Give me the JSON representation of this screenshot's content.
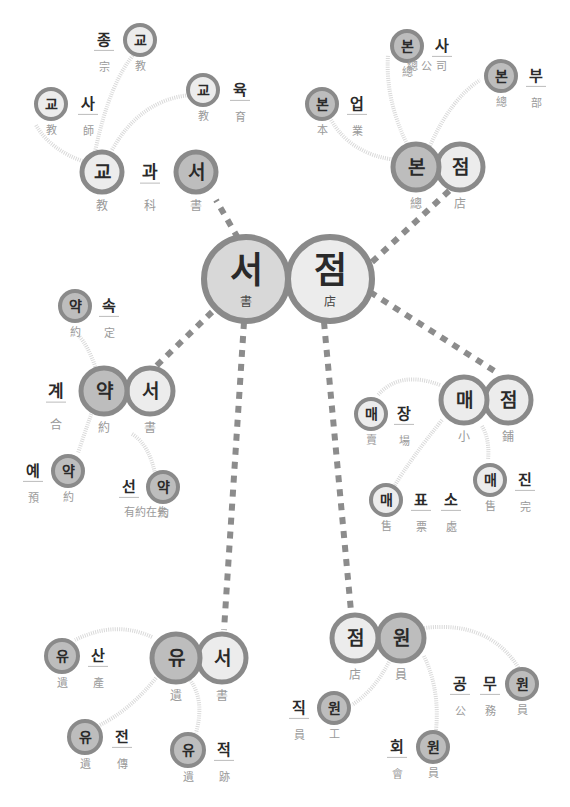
{
  "colors": {
    "ring": "#8a8a8a",
    "fill_light": "#ececec",
    "fill_mid": "#d8d8d8",
    "fill_dark": "#bdbdbd",
    "dash": "#8c8c8c",
    "arc": "#d9d9d9",
    "hangul": "#2a2a2a",
    "hanja": "#9a9a9a"
  },
  "center": {
    "word": "서점",
    "nodes": [
      {
        "x": 246,
        "y": 279,
        "r": 42,
        "char": "서",
        "hanja": "書",
        "fill": "fill_mid"
      },
      {
        "x": 330,
        "y": 279,
        "r": 42,
        "char": "점",
        "hanja": "店",
        "fill": "fill_light"
      }
    ]
  },
  "dashes": [
    {
      "x1": 238,
      "y1": 238,
      "x2": 216,
      "y2": 200
    },
    {
      "x1": 372,
      "y1": 262,
      "x2": 450,
      "y2": 190
    },
    {
      "x1": 212,
      "y1": 312,
      "x2": 150,
      "y2": 372
    },
    {
      "x1": 370,
      "y1": 292,
      "x2": 496,
      "y2": 372
    },
    {
      "x1": 244,
      "y1": 322,
      "x2": 224,
      "y2": 630
    },
    {
      "x1": 324,
      "y1": 322,
      "x2": 352,
      "y2": 622
    }
  ],
  "clusters": [
    {
      "name": "gyogwaseo",
      "word": "교과서",
      "nodes": [
        {
          "x": 102,
          "y": 172,
          "r": 20,
          "char": "교",
          "hanja": "教",
          "fill": "fill_light"
        },
        {
          "x": 196,
          "y": 172,
          "r": 20,
          "char": "서",
          "hanja": "書",
          "fill": "fill_dark"
        }
      ],
      "labels": [
        {
          "x": 150,
          "y": 172,
          "char": "과",
          "hanja": "科"
        }
      ],
      "arcs": [
        "M95,152 Q110,80 136,52",
        "M85,162 Q50,150 36,125",
        "M112,150 Q140,100 190,95"
      ],
      "sub": [
        {
          "word": "종교",
          "nodes": [
            {
              "x": 140,
              "y": 40,
              "r": 15,
              "char": "교",
              "hanja": "教",
              "fill": "fill_light"
            }
          ],
          "labels": [
            {
              "x": 104,
              "y": 40,
              "char": "종",
              "hanja": "宗"
            }
          ]
        },
        {
          "word": "교사",
          "nodes": [
            {
              "x": 51,
              "y": 104,
              "r": 15,
              "char": "교",
              "hanja": "教",
              "fill": "fill_light"
            }
          ],
          "labels": [
            {
              "x": 88,
              "y": 104,
              "char": "사",
              "hanja": "師"
            }
          ]
        },
        {
          "word": "교육",
          "nodes": [
            {
              "x": 203,
              "y": 90,
              "r": 15,
              "char": "교",
              "hanja": "教",
              "fill": "fill_light"
            }
          ],
          "labels": [
            {
              "x": 240,
              "y": 90,
              "char": "육",
              "hanja": "育"
            }
          ]
        }
      ]
    },
    {
      "name": "bonjeom",
      "word": "본점",
      "nodes": [
        {
          "x": 416,
          "y": 167,
          "r": 23,
          "char": "본",
          "hanja": "總",
          "fill": "fill_dark"
        },
        {
          "x": 460,
          "y": 167,
          "r": 23,
          "char": "점",
          "hanja": "店",
          "fill": "fill_light"
        }
      ],
      "labels": [],
      "arcs": [
        "M397,160 Q350,155 330,118",
        "M408,146 Q385,100 388,55",
        "M430,146 Q450,100 480,80"
      ],
      "sub": [
        {
          "word": "본사",
          "nodes": [
            {
              "x": 407,
              "y": 46,
              "r": 15,
              "char": "본",
              "hanja": "總",
              "fill": "fill_dark"
            }
          ],
          "labels": [
            {
              "x": 442,
              "y": 46,
              "char": "사",
              "hanja": ""
            }
          ],
          "hanja_text": {
            "x": 427,
            "y": 70,
            "text": "總 公 司"
          }
        },
        {
          "word": "본부",
          "nodes": [
            {
              "x": 501,
              "y": 76,
              "r": 15,
              "char": "본",
              "hanja": "總",
              "fill": "fill_dark"
            }
          ],
          "labels": [
            {
              "x": 536,
              "y": 76,
              "char": "부",
              "hanja": "部"
            }
          ]
        },
        {
          "word": "본업",
          "nodes": [
            {
              "x": 322,
              "y": 104,
              "r": 15,
              "char": "본",
              "hanja": "本",
              "fill": "fill_dark"
            }
          ],
          "labels": [
            {
              "x": 357,
              "y": 104,
              "char": "업",
              "hanja": "業"
            }
          ]
        }
      ]
    },
    {
      "name": "yakseo",
      "word": "약서",
      "nodes": [
        {
          "x": 104,
          "y": 391,
          "r": 23,
          "char": "약",
          "hanja": "約",
          "fill": "fill_dark"
        },
        {
          "x": 150,
          "y": 391,
          "r": 23,
          "char": "서",
          "hanja": "書",
          "fill": "fill_light"
        }
      ],
      "labels": [
        {
          "x": 56,
          "y": 391,
          "char": "계",
          "hanja": "合"
        }
      ],
      "arcs": [
        "M96,369 Q88,345 78,335",
        "M92,412 Q85,432 78,453",
        "M132,434 Q150,445 156,478"
      ],
      "sub": [
        {
          "word": "약속",
          "nodes": [
            {
              "x": 75,
              "y": 306,
              "r": 15,
              "char": "약",
              "hanja": "約",
              "fill": "fill_dark"
            }
          ],
          "labels": [
            {
              "x": 109,
              "y": 306,
              "char": "속",
              "hanja": "定"
            }
          ]
        },
        {
          "word": "예약",
          "nodes": [
            {
              "x": 68,
              "y": 471,
              "r": 15,
              "char": "약",
              "hanja": "約",
              "fill": "fill_dark"
            }
          ],
          "labels": [
            {
              "x": 33,
              "y": 471,
              "char": "예",
              "hanja": "預"
            }
          ]
        },
        {
          "word": "선약",
          "nodes": [
            {
              "x": 163,
              "y": 487,
              "r": 15,
              "char": "약",
              "hanja": "約",
              "fill": "fill_dark"
            }
          ],
          "labels": [
            {
              "x": 129,
              "y": 487,
              "char": "선",
              "hanja": ""
            }
          ],
          "hanja_text": {
            "x": 146,
            "y": 516,
            "text": "有約在先"
          }
        }
      ]
    },
    {
      "name": "maejeom",
      "word": "매점",
      "nodes": [
        {
          "x": 464,
          "y": 400,
          "r": 23,
          "char": "매",
          "hanja": "小",
          "fill": "fill_light"
        },
        {
          "x": 508,
          "y": 400,
          "r": 23,
          "char": "점",
          "hanja": "鋪",
          "fill": "fill_light"
        }
      ],
      "labels": [],
      "arcs": [
        "M440,385 Q400,370 378,395",
        "M442,420 Q410,460 395,485",
        "M482,426 Q490,440 488,460"
      ],
      "sub": [
        {
          "word": "매장",
          "nodes": [
            {
              "x": 371,
              "y": 414,
              "r": 15,
              "char": "매",
              "hanja": "賣",
              "fill": "fill_light"
            }
          ],
          "labels": [
            {
              "x": 404,
              "y": 414,
              "char": "장",
              "hanja": "場"
            }
          ]
        },
        {
          "word": "매표소",
          "nodes": [
            {
              "x": 386,
              "y": 500,
              "r": 15,
              "char": "매",
              "hanja": "售",
              "fill": "fill_light"
            }
          ],
          "labels": [
            {
              "x": 421,
              "y": 500,
              "char": "표",
              "hanja": "票"
            },
            {
              "x": 451,
              "y": 500,
              "char": "소",
              "hanja": "處"
            }
          ]
        },
        {
          "word": "매진",
          "nodes": [
            {
              "x": 490,
              "y": 480,
              "r": 15,
              "char": "매",
              "hanja": "售",
              "fill": "fill_light"
            }
          ],
          "labels": [
            {
              "x": 525,
              "y": 480,
              "char": "진",
              "hanja": "完"
            }
          ]
        }
      ]
    },
    {
      "name": "yuseo",
      "word": "유서",
      "nodes": [
        {
          "x": 176,
          "y": 658,
          "r": 24,
          "char": "유",
          "hanja": "遺",
          "fill": "fill_dark"
        },
        {
          "x": 222,
          "y": 658,
          "r": 24,
          "char": "서",
          "hanja": "書",
          "fill": "fill_light"
        }
      ],
      "labels": [],
      "arcs": [
        "M152,637 Q115,620 75,640",
        "M156,678 Q130,710 100,725",
        "M190,680 Q205,700 196,733"
      ],
      "sub": [
        {
          "word": "유산",
          "nodes": [
            {
              "x": 62,
              "y": 656,
              "r": 16,
              "char": "유",
              "hanja": "遺",
              "fill": "fill_dark"
            }
          ],
          "labels": [
            {
              "x": 98,
              "y": 656,
              "char": "산",
              "hanja": "產"
            }
          ]
        },
        {
          "word": "유전",
          "nodes": [
            {
              "x": 85,
              "y": 737,
              "r": 16,
              "char": "유",
              "hanja": "遺",
              "fill": "fill_dark"
            }
          ],
          "labels": [
            {
              "x": 122,
              "y": 737,
              "char": "전",
              "hanja": "傳"
            }
          ]
        },
        {
          "word": "유적",
          "nodes": [
            {
              "x": 188,
              "y": 750,
              "r": 16,
              "char": "유",
              "hanja": "遺",
              "fill": "fill_dark"
            }
          ],
          "labels": [
            {
              "x": 224,
              "y": 750,
              "char": "적",
              "hanja": "跡"
            }
          ]
        }
      ]
    },
    {
      "name": "jeomwon",
      "word": "점원",
      "nodes": [
        {
          "x": 355,
          "y": 638,
          "r": 23,
          "char": "점",
          "hanja": "店",
          "fill": "fill_light"
        },
        {
          "x": 401,
          "y": 638,
          "r": 23,
          "char": "원",
          "hanja": "員",
          "fill": "fill_dark"
        }
      ],
      "labels": [],
      "arcs": [
        "M424,628 Q490,620 520,670",
        "M390,660 Q375,690 352,705",
        "M424,656 Q440,690 436,730"
      ],
      "sub": [
        {
          "word": "공무원",
          "nodes": [
            {
              "x": 522,
              "y": 684,
              "r": 15,
              "char": "원",
              "hanja": "員",
              "fill": "fill_dark"
            }
          ],
          "labels": [
            {
              "x": 460,
              "y": 684,
              "char": "공",
              "hanja": "公"
            },
            {
              "x": 490,
              "y": 684,
              "char": "무",
              "hanja": "務"
            }
          ]
        },
        {
          "word": "직원",
          "nodes": [
            {
              "x": 334,
              "y": 708,
              "r": 15,
              "char": "원",
              "hanja": "工",
              "fill": "fill_dark"
            }
          ],
          "labels": [
            {
              "x": 299,
              "y": 708,
              "char": "직",
              "hanja": "員"
            }
          ]
        },
        {
          "word": "회원",
          "nodes": [
            {
              "x": 433,
              "y": 747,
              "r": 15,
              "char": "원",
              "hanja": "員",
              "fill": "fill_dark"
            }
          ],
          "labels": [
            {
              "x": 397,
              "y": 747,
              "char": "회",
              "hanja": "會"
            }
          ]
        }
      ]
    }
  ]
}
